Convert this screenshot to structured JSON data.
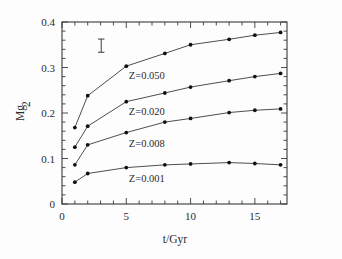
{
  "figure": {
    "background": "#fdfdfd",
    "frame_color": "#3a3a3a",
    "line_color": "#3a3a3a",
    "marker_color": "#111111"
  },
  "axes": {
    "x": {
      "label": "t/Gyr",
      "ticks": [
        0,
        5,
        10,
        15
      ],
      "tick_labels": [
        "0",
        "5",
        "10",
        "15"
      ],
      "minor_step": 1,
      "range": [
        0,
        17.5
      ]
    },
    "y": {
      "label": "Mg",
      "label_sub": "2",
      "ticks": [
        0,
        0.1,
        0.2,
        0.3,
        0.4
      ],
      "tick_labels": [
        "0",
        "0.1",
        "0.2",
        "0.3",
        "0.4"
      ],
      "minor_step": 0.02,
      "range": [
        0,
        0.4
      ]
    }
  },
  "annotations": {
    "errorbar": {
      "name": "error-bar-marker",
      "x": 3.05,
      "y": 0.348,
      "half_height": 0.0145
    }
  },
  "chart_data": {
    "type": "line",
    "title": "",
    "xlabel": "t/Gyr",
    "ylabel": "Mg2",
    "xlim": [
      0,
      17.5
    ],
    "ylim": [
      0,
      0.4
    ],
    "grid": false,
    "legend": "inline-labels",
    "x": [
      1,
      2,
      5,
      8,
      10,
      13,
      15,
      17
    ],
    "series": [
      {
        "name": "Z=0.050",
        "label": "Z=0.050",
        "label_x": 5.2,
        "label_y": 0.275,
        "values": [
          0.168,
          0.238,
          0.303,
          0.331,
          0.35,
          0.362,
          0.371,
          0.377
        ]
      },
      {
        "name": "Z=0.020",
        "label": "Z=0.020",
        "label_x": 5.2,
        "label_y": 0.196,
        "values": [
          0.125,
          0.171,
          0.225,
          0.244,
          0.257,
          0.271,
          0.28,
          0.287
        ]
      },
      {
        "name": "Z=0.008",
        "label": "Z=0.008",
        "label_x": 5.2,
        "label_y": 0.126,
        "values": [
          0.086,
          0.13,
          0.157,
          0.18,
          0.188,
          0.201,
          0.206,
          0.209
        ]
      },
      {
        "name": "Z=0.001",
        "label": "Z=0.001",
        "label_x": 5.2,
        "label_y": 0.049,
        "values": [
          0.048,
          0.067,
          0.08,
          0.086,
          0.088,
          0.091,
          0.089,
          0.086
        ]
      }
    ]
  }
}
